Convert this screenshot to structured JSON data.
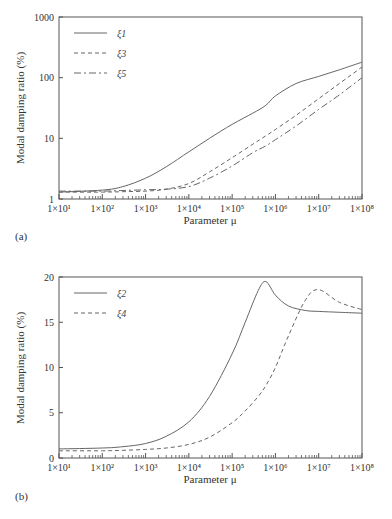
{
  "chart_data": [
    {
      "panel": "(a)",
      "type": "line",
      "title": "",
      "xlabel": "Parameter μ",
      "ylabel": "Modal damping ratio (%)",
      "xscale": "log",
      "yscale": "log",
      "xlim": [
        10,
        100000000
      ],
      "ylim": [
        1,
        1000
      ],
      "x_tick_labels": [
        "1×10¹",
        "1×10²",
        "1×10³",
        "1×10⁴",
        "1×10⁵",
        "1×10⁶",
        "1×10⁷",
        "1×10⁸"
      ],
      "y_tick_labels": [
        "1",
        "10",
        "100",
        "1000"
      ],
      "legend_position": "upper left",
      "grid": false,
      "x": [
        10,
        100,
        300,
        1000,
        3000,
        10000,
        30000,
        100000,
        300000,
        600000,
        1000000,
        3000000,
        10000000,
        30000000,
        100000000
      ],
      "series": [
        {
          "name": "ξ1",
          "style": "solid",
          "values": [
            1.3,
            1.4,
            1.6,
            2.2,
            3.4,
            6.0,
            10.0,
            17.0,
            26.0,
            35.0,
            50.0,
            80.0,
            105.0,
            135.0,
            180.0
          ]
        },
        {
          "name": "ξ3",
          "style": "dashed",
          "values": [
            1.3,
            1.3,
            1.32,
            1.35,
            1.45,
            1.8,
            2.8,
            4.8,
            8.0,
            11.0,
            14.0,
            24.0,
            45.0,
            80.0,
            150.0
          ]
        },
        {
          "name": "ξ5",
          "style": "dashdot",
          "values": [
            1.35,
            1.35,
            1.38,
            1.42,
            1.45,
            1.6,
            2.2,
            3.5,
            5.8,
            7.5,
            9.5,
            16.0,
            30.0,
            52.0,
            100.0
          ]
        }
      ]
    },
    {
      "panel": "(b)",
      "type": "line",
      "title": "",
      "xlabel": "Parameter μ",
      "ylabel": "Modal damping ratio (%)",
      "xscale": "log",
      "yscale": "linear",
      "xlim": [
        10,
        100000000
      ],
      "ylim": [
        0,
        20
      ],
      "x_tick_labels": [
        "1×10¹",
        "1×10²",
        "1×10³",
        "1×10⁴",
        "1×10⁵",
        "1×10⁶",
        "1×10⁷",
        "1×10⁸"
      ],
      "y_tick_labels": [
        "0",
        "5",
        "10",
        "15",
        "20"
      ],
      "legend_position": "upper left",
      "grid": false,
      "x": [
        10,
        100,
        300,
        1000,
        3000,
        10000,
        30000,
        100000,
        200000,
        400000,
        600000,
        1000000,
        2000000,
        5000000,
        10000000,
        30000000,
        100000000
      ],
      "series": [
        {
          "name": "ξ2",
          "style": "solid",
          "values": [
            1.0,
            1.1,
            1.25,
            1.6,
            2.4,
            4.0,
            6.8,
            11.5,
            15.0,
            18.5,
            19.5,
            18.0,
            16.8,
            16.3,
            16.2,
            16.1,
            16.0
          ]
        },
        {
          "name": "ξ4",
          "style": "dashed",
          "values": [
            0.8,
            0.8,
            0.85,
            0.95,
            1.1,
            1.5,
            2.3,
            3.9,
            5.2,
            6.8,
            8.0,
            10.0,
            13.5,
            17.5,
            18.6,
            17.2,
            16.4
          ]
        }
      ]
    }
  ],
  "panels": {
    "a": {
      "label": "(a)",
      "xlabel": "Parameter μ",
      "ylabel": "Modal damping ratio (%)"
    },
    "b": {
      "label": "(b)",
      "xlabel": "Parameter μ",
      "ylabel": "Modal damping ratio (%)"
    }
  }
}
